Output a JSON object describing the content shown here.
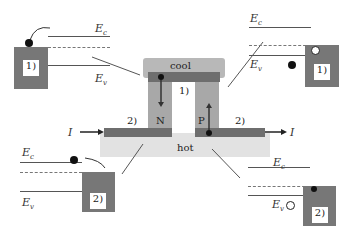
{
  "device": {
    "cool_label": "cool",
    "hot_label": "hot",
    "n_label": "N",
    "p_label": "P",
    "junction_top": "1)",
    "junction_left": "2)",
    "junction_right": "2)",
    "current_in": "I",
    "current_out": "I"
  },
  "panels": {
    "top_left": {
      "ec": "E",
      "ec_sub": "c",
      "ev": "E",
      "ev_sub": "v",
      "box": "1)"
    },
    "top_right": {
      "ec": "E",
      "ec_sub": "c",
      "ev": "E",
      "ev_sub": "v",
      "box": "1)"
    },
    "bottom_left": {
      "ec": "E",
      "ec_sub": "c",
      "ev": "E",
      "ev_sub": "v",
      "box": "2)"
    },
    "bottom_right": {
      "ec": "E",
      "ec_sub": "c",
      "ev": "E",
      "ev_sub": "v",
      "box": "2)"
    }
  },
  "colors": {
    "cool": "#b5b5b5",
    "hot": "#e2e2e2",
    "metal": "#6e6e6e",
    "leg": "#a8a8a8"
  }
}
